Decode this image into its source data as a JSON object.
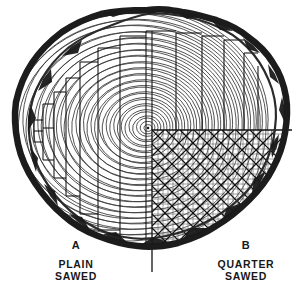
{
  "figure": {
    "kind": "engraving-diagram",
    "background_color": "#ffffff",
    "ink_color": "#1a1a1a",
    "ring_color": "#3a3a3a",
    "bark_color": "#202020",
    "cut_line_color": "#111111",
    "width": 301,
    "height": 301
  },
  "log": {
    "pith_center_x": 148,
    "pith_center_y": 128,
    "outer_radius_x": 137,
    "outer_radius_y": 118,
    "bark_thickness": 6,
    "growth_ring_count": 34,
    "ring_spacing_px": 3.4
  },
  "sections": {
    "plain": {
      "letter": "A",
      "name_line1": "PLAIN",
      "name_line2": "SAWED",
      "board_orientation": "vertical-parallel",
      "board_count": 12,
      "board_widths_px": [
        8,
        10,
        12,
        14,
        16,
        20,
        26,
        26,
        24,
        20,
        15,
        12
      ]
    },
    "quarter": {
      "letter": "B",
      "name_line1": "QUARTER",
      "name_line2": "SAWED",
      "board_orientation": "diagonal-crosshatch",
      "quadrant": "lower-right",
      "quadrant_origin_x": 152,
      "quadrant_origin_y": 130,
      "diagonal_angle_deg": 45,
      "board_count": 14
    }
  },
  "captions": [
    {
      "id": "plain",
      "letter": "A",
      "line1": "PLAIN",
      "line2": "SAWED"
    },
    {
      "id": "quarter",
      "letter": "B",
      "line1": "QUARTER",
      "line2": "SAWED"
    }
  ]
}
